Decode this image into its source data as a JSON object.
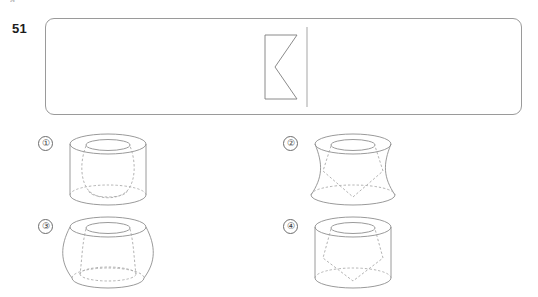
{
  "page": {
    "background_color": "#ffffff",
    "line_color": "#8e8e8e",
    "hidden_line_color": "#a5a5a5",
    "text_color": "#1c1c1c",
    "clipped_top_text": "a"
  },
  "question": {
    "number": "51",
    "stem_box": {
      "x": 45,
      "y": 18,
      "width": 477,
      "height": 97,
      "corner_radius": 9,
      "border_color": "#9a9a9a"
    },
    "stem_figure": {
      "name": "rotation-source-shape",
      "description": "Rectangle with a triangular notch cut from its right side forming a K/arrowhead profile, beside a vertical rotation axis on the right",
      "rect": {
        "left": 10,
        "top": 10,
        "right": 42,
        "bottom": 74
      },
      "notch_apex": {
        "x": 20,
        "y": 42
      },
      "axis": {
        "x": 52,
        "top": 2,
        "bottom": 82
      }
    }
  },
  "options": [
    {
      "id": "1",
      "label": "①",
      "outer_solid": "cylinder",
      "inner_solid": "sphere",
      "inner_style": "dashed",
      "description": "Upright cylinder with a dashed sphere/oval inscribed inside"
    },
    {
      "id": "2",
      "label": "②",
      "outer_solid": "hyperboloid",
      "inner_solid": "inverted-cone",
      "inner_style": "dashed",
      "description": "Concave hourglass solid with a dashed downward-pointing cone inside"
    },
    {
      "id": "3",
      "label": "③",
      "outer_solid": "barrel",
      "inner_solid": "hyperboloid",
      "inner_style": "dashed",
      "description": "Convex barrel solid with a dashed concave waisted solid inside"
    },
    {
      "id": "4",
      "label": "④",
      "outer_solid": "cylinder",
      "inner_solid": "inverted-cone",
      "inner_style": "dashed",
      "description": "Upright cylinder with a dashed downward-pointing cone inside"
    }
  ]
}
